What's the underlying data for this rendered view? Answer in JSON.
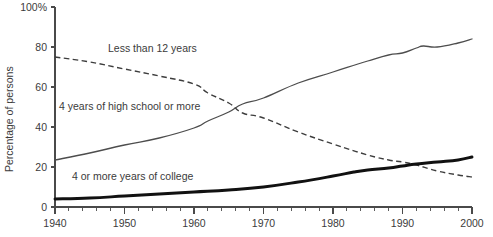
{
  "chart_data": {
    "type": "line",
    "title": "",
    "xlabel": "",
    "ylabel": "Percentage of persons",
    "xlim": [
      1940,
      2000
    ],
    "ylim": [
      0,
      100
    ],
    "grid": false,
    "legend_position": "inline-annotations",
    "x_ticks": [
      "1940",
      "1950",
      "1960",
      "1970",
      "1980",
      "1990",
      "2000"
    ],
    "x_tick_values": [
      1940,
      1950,
      1960,
      1970,
      1980,
      1990,
      2000
    ],
    "y_ticks": [
      "0",
      "20",
      "40",
      "60",
      "80",
      "100%"
    ],
    "y_tick_values": [
      0,
      20,
      40,
      60,
      80,
      100
    ],
    "minor_x_tick_interval": 2,
    "series": [
      {
        "name": "Less than 12 years",
        "style": "dashed",
        "color": "#3d3d3d",
        "x": [
          1940,
          1945,
          1950,
          1955,
          1960,
          1962,
          1965,
          1967,
          1970,
          1975,
          1980,
          1985,
          1988,
          1990,
          1992,
          1995,
          1998,
          2000
        ],
        "values": [
          75.0,
          72.5,
          69.0,
          65.5,
          61.5,
          57.0,
          52.0,
          47.0,
          44.5,
          37.5,
          31.5,
          26.0,
          23.5,
          22.5,
          21.0,
          18.0,
          16.0,
          15.0
        ]
      },
      {
        "name": "4 years of high school or more",
        "style": "solid-thin",
        "color": "#4d4d4d",
        "x": [
          1940,
          1945,
          1950,
          1955,
          1960,
          1962,
          1965,
          1967,
          1970,
          1975,
          1980,
          1985,
          1988,
          1990,
          1992,
          1993,
          1995,
          1998,
          2000
        ],
        "values": [
          23.5,
          27.0,
          31.0,
          34.5,
          39.5,
          43.0,
          47.5,
          51.5,
          54.5,
          62.0,
          67.5,
          73.0,
          76.0,
          77.0,
          79.5,
          80.5,
          80.0,
          82.0,
          84.0
        ]
      },
      {
        "name": "4 or more years of college",
        "style": "solid-bold",
        "color": "#111111",
        "x": [
          1940,
          1945,
          1950,
          1955,
          1960,
          1965,
          1970,
          1975,
          1980,
          1983,
          1985,
          1988,
          1990,
          1992,
          1995,
          1998,
          2000
        ],
        "values": [
          4.0,
          4.5,
          5.5,
          6.5,
          7.5,
          8.5,
          10.0,
          12.5,
          15.5,
          17.5,
          18.5,
          19.5,
          20.5,
          21.5,
          22.5,
          23.5,
          25.0
        ]
      }
    ],
    "annotations": [
      {
        "text": "Less than 12 years",
        "x_px": 108,
        "y_px": 52
      },
      {
        "text": "4 years of high school or more",
        "x_px": 59,
        "y_px": 110
      },
      {
        "text": "4 or more years of college",
        "x_px": 72,
        "y_px": 180
      }
    ]
  }
}
